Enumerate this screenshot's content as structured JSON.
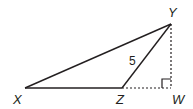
{
  "diagram": {
    "type": "geometry-triangle",
    "stroke_color": "#231f20",
    "vertices": {
      "X": {
        "label": "X",
        "x": 25,
        "y": 88
      },
      "Y": {
        "label": "Y",
        "x": 171,
        "y": 24
      },
      "Z": {
        "label": "Z",
        "x": 122,
        "y": 88
      },
      "W": {
        "label": "W",
        "x": 171,
        "y": 88
      }
    },
    "segments": [
      {
        "from": "X",
        "to": "Y",
        "style": "solid"
      },
      {
        "from": "X",
        "to": "Z",
        "style": "solid"
      },
      {
        "from": "Z",
        "to": "Y",
        "style": "solid",
        "length_label": "5"
      },
      {
        "from": "Z",
        "to": "W",
        "style": "dashed"
      },
      {
        "from": "Y",
        "to": "W",
        "style": "dashed"
      }
    ],
    "right_angle_marker": {
      "at": "W",
      "size": 9
    },
    "labels": {
      "X": "X",
      "Y": "Y",
      "Z": "Z",
      "W": "W",
      "ZY_length": "5"
    }
  }
}
